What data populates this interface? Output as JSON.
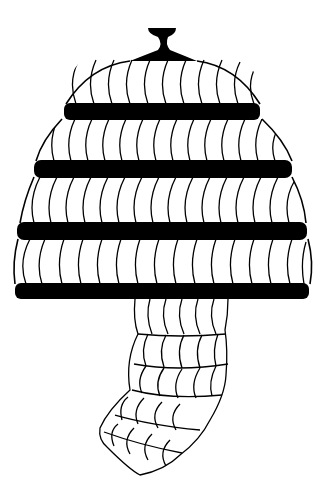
{
  "image": {
    "subject": "Boar's tusk helmet line drawing",
    "background": "#ffffff",
    "ink": "#000000",
    "bands": 4,
    "cheek_guard": "one hanging segmented cheek piece"
  }
}
